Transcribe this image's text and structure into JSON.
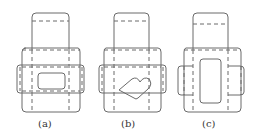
{
  "figures": [
    {
      "id": "a",
      "caption": "(a)",
      "window_shape": "rounded-rectangle"
    },
    {
      "id": "b",
      "caption": "(b)",
      "window_shape": "heart"
    },
    {
      "id": "c",
      "caption": "(c)",
      "window_shape": "tall-rounded-rectangle"
    }
  ],
  "colors": {
    "line": "#6a6a6a",
    "background": "#ffffff"
  }
}
